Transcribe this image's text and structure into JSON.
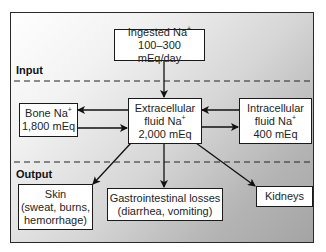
{
  "diagram": {
    "type": "flowchart",
    "sections": {
      "input_label": "Input",
      "output_label": "Output"
    },
    "nodes": {
      "ingested": {
        "line1": "Ingested Na",
        "sup1": "+",
        "line2": "100–300 mEq/day"
      },
      "bone": {
        "line1": "Bone Na",
        "sup1": "+",
        "line2": "1,800 mEq"
      },
      "ecf": {
        "line1": "Extracellular",
        "line2": "fluid Na",
        "sup2": "+",
        "line3": "2,000 mEq"
      },
      "icf": {
        "line1": "Intracellular",
        "line2": "fluid Na",
        "sup2": "+",
        "line3": "400 mEq"
      },
      "skin": {
        "line1": "Skin",
        "line2": "(sweat, burns,",
        "line3": "hemorrhage)"
      },
      "gi": {
        "line1": "Gastrointestinal losses",
        "line2": "(diarrhea, vomiting)"
      },
      "kidneys": {
        "line1": "Kidneys"
      }
    },
    "edges": [
      {
        "from": "ingested",
        "to": "ecf"
      },
      {
        "from": "ecf",
        "to": "bone"
      },
      {
        "from": "bone",
        "to": "ecf"
      },
      {
        "from": "icf",
        "to": "ecf"
      },
      {
        "from": "ecf",
        "to": "icf"
      },
      {
        "from": "ecf",
        "to": "skin"
      },
      {
        "from": "ecf",
        "to": "gi"
      },
      {
        "from": "ecf",
        "to": "kidneys"
      }
    ],
    "colors": {
      "border": "#1a1a1a",
      "box_fill": "#ffffff",
      "gradient_start": "#ffffff",
      "gradient_end": "#a4a4a4"
    }
  }
}
